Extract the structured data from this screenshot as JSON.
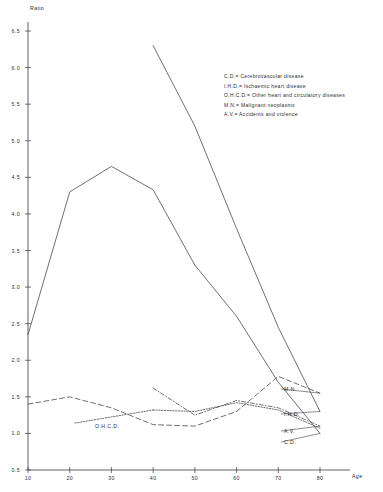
{
  "chart_data": {
    "type": "line",
    "title": "",
    "xlabel": "Age",
    "ylabel": "Ratio",
    "xlim": [
      10,
      80
    ],
    "ylim": [
      0.5,
      6.5
    ],
    "grid": false,
    "legend_position": "upper-right",
    "x_ticks": [
      "10",
      "20",
      "30",
      "40",
      "50",
      "60",
      "70",
      "80"
    ],
    "y_ticks": [
      "0.5",
      "1.0",
      "1.5",
      "2.0",
      "2.5",
      "3.0",
      "3.5",
      "4.0",
      "4.5",
      "5.0",
      "5.5",
      "6.0",
      "6.5"
    ],
    "categories": [
      10,
      20,
      30,
      40,
      50,
      60,
      70,
      80
    ],
    "series": [
      {
        "name": "C.D.",
        "label": "C.D.",
        "style": "solid",
        "x": [
          10,
          20,
          30,
          40,
          50,
          60,
          70,
          80
        ],
        "values": [
          2.35,
          4.3,
          4.65,
          4.33,
          3.3,
          2.6,
          1.7,
          1.0
        ]
      },
      {
        "name": "I.H.D.",
        "label": "I.H.D.",
        "style": "solid",
        "x": [
          40,
          50,
          60,
          70,
          80
        ],
        "values": [
          6.3,
          5.2,
          3.8,
          2.45,
          1.3
        ]
      },
      {
        "name": "M.N.",
        "label": "M.N.",
        "style": "dashed",
        "x": [
          10,
          20,
          30,
          40,
          50,
          60,
          70,
          80
        ],
        "values": [
          1.4,
          1.5,
          1.35,
          1.12,
          1.1,
          1.3,
          1.78,
          1.55
        ]
      },
      {
        "name": "O.H.C.D.",
        "label": "O.H.C.D.",
        "style": "dotted",
        "x": [
          40,
          50,
          60,
          70,
          80
        ],
        "values": [
          1.32,
          1.3,
          1.42,
          1.32,
          1.07
        ]
      },
      {
        "name": "A.V.",
        "label": "A.V.",
        "style": "dashdot",
        "x": [
          40,
          50,
          60,
          70,
          80
        ],
        "values": [
          1.62,
          1.25,
          1.45,
          1.35,
          1.1
        ]
      }
    ],
    "legend_entries": [
      "C.D.= Cerebrovascular disease",
      "I.H.D.= Ischaemic heart disease",
      "O.H.C.D.= Other heart and circulatory diseases",
      "M.N.= Malignant neoplasms",
      "A.V.= Accidents and violence"
    ]
  }
}
